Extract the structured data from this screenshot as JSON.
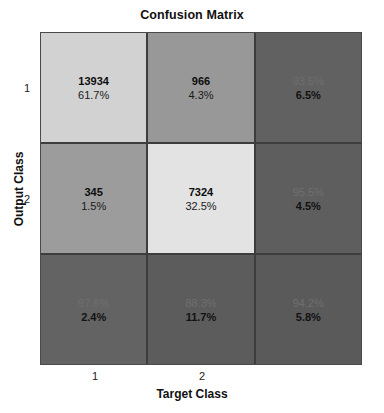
{
  "chart_data": {
    "type": "heatmap",
    "title": "Confusion Matrix",
    "xlabel": "Target Class",
    "ylabel": "Output Class",
    "xticks": [
      "1",
      "2"
    ],
    "yticks": [
      "1",
      "2"
    ],
    "classes": [
      "1",
      "2"
    ],
    "counts": [
      [
        13934,
        966
      ],
      [
        345,
        7324
      ]
    ],
    "total": 22569,
    "grid": false,
    "legend": "none",
    "cells": [
      [
        {
          "line1": "13934",
          "line2": "61.7%",
          "kind": "count",
          "fill": "#d2d2d2"
        },
        {
          "line1": "966",
          "line2": "4.3%",
          "kind": "count",
          "fill": "#989898"
        },
        {
          "line1": "93.5%",
          "line2": "6.5%",
          "kind": "summary",
          "fill": "#616161"
        }
      ],
      [
        {
          "line1": "345",
          "line2": "1.5%",
          "kind": "count",
          "fill": "#9c9c9c"
        },
        {
          "line1": "7324",
          "line2": "32.5%",
          "kind": "count",
          "fill": "#e3e3e3"
        },
        {
          "line1": "95.5%",
          "line2": "4.5%",
          "kind": "summary",
          "fill": "#5e5e5e"
        }
      ],
      [
        {
          "line1": "97.6%",
          "line2": "2.4%",
          "kind": "summary",
          "fill": "#636363"
        },
        {
          "line1": "88.3%",
          "line2": "11.7%",
          "kind": "summary",
          "fill": "#5c5c5c"
        },
        {
          "line1": "94.2%",
          "line2": "5.8%",
          "kind": "summary",
          "fill": "#5a5a5a"
        }
      ]
    ]
  },
  "chart": {
    "title": "Confusion Matrix",
    "x_axis_label": "Target Class",
    "y_axis_label": "Output Class",
    "xtick_1": "1",
    "xtick_2": "2",
    "ytick_1": "1",
    "ytick_2": "2"
  },
  "cells": {
    "r0c0": {
      "line1": "13934",
      "line2": "61.7%"
    },
    "r0c1": {
      "line1": "966",
      "line2": "4.3%"
    },
    "r0c2": {
      "line1": "93.5%",
      "line2": "6.5%"
    },
    "r1c0": {
      "line1": "345",
      "line2": "1.5%"
    },
    "r1c1": {
      "line1": "7324",
      "line2": "32.5%"
    },
    "r1c2": {
      "line1": "95.5%",
      "line2": "4.5%"
    },
    "r2c0": {
      "line1": "97.6%",
      "line2": "2.4%"
    },
    "r2c1": {
      "line1": "88.3%",
      "line2": "11.7%"
    },
    "r2c2": {
      "line1": "94.2%",
      "line2": "5.8%"
    }
  }
}
